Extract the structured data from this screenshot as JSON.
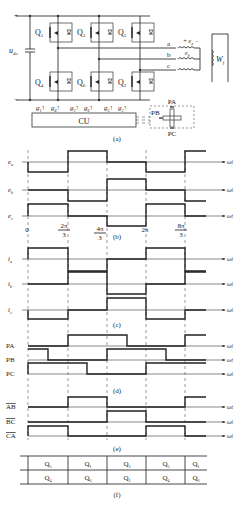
{
  "circuit": {
    "dc_label": "u",
    "dc_sub": "dc",
    "switches_top": [
      {
        "name": "Q",
        "sub": "1"
      },
      {
        "name": "Q",
        "sub": "3"
      },
      {
        "name": "Q",
        "sub": "5"
      }
    ],
    "switches_bottom": [
      {
        "name": "Q",
        "sub": "4"
      },
      {
        "name": "Q",
        "sub": "6"
      },
      {
        "name": "Q",
        "sub": "2"
      }
    ],
    "phases": [
      "a",
      "b",
      "c"
    ],
    "emf_labels": [
      {
        "name": "e",
        "sub": "a"
      },
      {
        "name": "e",
        "sub": "b"
      }
    ],
    "winding_label": "W",
    "winding_sub": "f",
    "gates": [
      {
        "name": "g",
        "sub": "1"
      },
      {
        "name": "g",
        "sub": "4"
      },
      {
        "name": "g",
        "sub": "3"
      },
      {
        "name": "g",
        "sub": "6"
      },
      {
        "name": "g",
        "sub": "5"
      },
      {
        "name": "g",
        "sub": "2"
      }
    ],
    "control_unit": "CU",
    "sensors": [
      "PA",
      "PB",
      "PC"
    ],
    "caption": "(a)"
  },
  "waveforms": {
    "x_axis_label": "ωt",
    "ticks": [
      {
        "label": "0"
      },
      {
        "num": "2π",
        "den": "3"
      },
      {
        "num": "4π",
        "den": "3"
      },
      {
        "label": "2π"
      },
      {
        "num": "8π",
        "den": "3"
      }
    ],
    "emf": {
      "labels": [
        {
          "name": "e",
          "sub": "a"
        },
        {
          "name": "e",
          "sub": "b"
        },
        {
          "name": "e",
          "sub": "c"
        }
      ],
      "caption": "(b)"
    },
    "current": {
      "labels": [
        {
          "name": "i",
          "sub": "a"
        },
        {
          "name": "i",
          "sub": "b"
        },
        {
          "name": "i",
          "sub": "c"
        }
      ],
      "caption": "(c)"
    },
    "hall": {
      "labels": [
        "PA",
        "PB",
        "PC"
      ],
      "caption": "(d)"
    },
    "logic": {
      "labels": [
        "AB",
        "BC",
        "CA"
      ],
      "caption": "(e)"
    }
  },
  "conduction_table": {
    "top_row": [
      {
        "name": "Q",
        "sub": "5"
      },
      {
        "name": "Q",
        "sub": "1"
      },
      {
        "name": "Q",
        "sub": "3"
      },
      {
        "name": "Q",
        "sub": "5"
      },
      {
        "name": "Q",
        "sub": "1"
      }
    ],
    "bottom_row": [
      {
        "name": "Q",
        "sub": "4"
      },
      {
        "name": "Q",
        "sub": "6"
      },
      {
        "name": "Q",
        "sub": "2"
      },
      {
        "name": "Q",
        "sub": "4"
      },
      {
        "name": "Q",
        "sub": "6"
      }
    ],
    "caption": "(f)"
  }
}
